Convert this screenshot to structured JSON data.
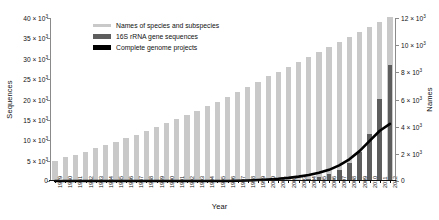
{
  "chart_data": {
    "type": "bar",
    "title": "",
    "xlabel": "Year",
    "ylabel": "Sequences",
    "ylabel_right": "Names",
    "grid": false,
    "legend_position": "top-left",
    "categories": [
      "1979",
      "1980",
      "1981",
      "1982",
      "1983",
      "1984",
      "1985",
      "1986",
      "1987",
      "1988",
      "1989",
      "1990",
      "1991",
      "1992",
      "1993",
      "1994",
      "1995",
      "1996",
      "1997",
      "1998",
      "1999",
      "2000",
      "2001",
      "2002",
      "2003",
      "2004",
      "2005",
      "2006",
      "2007",
      "2008",
      "2009",
      "2010",
      "2011",
      "2012"
    ],
    "ylim": [
      0,
      40000
    ],
    "yticks": [
      0,
      5000,
      10000,
      15000,
      20000,
      25000,
      30000,
      35000,
      40000
    ],
    "ytick_labels": [
      "0",
      "5 × 10³",
      "10 × 10³",
      "15 × 10³",
      "20 × 10³",
      "25 × 10³",
      "30 × 10³",
      "35 × 10³",
      "40 × 10³"
    ],
    "ylim_right": [
      0,
      12000
    ],
    "yticks_right": [
      0,
      2000,
      4000,
      6000,
      8000,
      10000,
      12000
    ],
    "ytick_labels_right": [
      "0",
      "2 × 10³",
      "4 × 10³",
      "6 × 10³",
      "8 × 10³",
      "10 × 10³",
      "12 × 10³"
    ],
    "series": [
      {
        "name": "Names of species and subspecies",
        "type": "bar",
        "axis": "right",
        "color": "#c9c9c9",
        "values": [
          1500,
          1750,
          1950,
          2150,
          2400,
          2650,
          2900,
          3150,
          3400,
          3700,
          3950,
          4250,
          4550,
          4850,
          5150,
          5500,
          5850,
          6200,
          6550,
          6950,
          7300,
          7700,
          8050,
          8400,
          8750,
          9100,
          9500,
          9900,
          10250,
          10600,
          11000,
          11350,
          11700,
          12050
        ]
      },
      {
        "name": "16S rRNA gene sequences",
        "type": "bar",
        "axis": "left",
        "color": "#5d5d5d",
        "values": [
          0,
          0,
          0,
          0,
          0,
          0,
          0,
          0,
          0,
          0,
          0,
          0,
          0,
          0,
          0,
          0,
          0,
          0,
          0,
          0,
          0,
          0,
          0,
          0,
          200,
          500,
          900,
          1600,
          2700,
          4300,
          7100,
          11500,
          20200,
          28500
        ]
      },
      {
        "name": "Complete genome projects",
        "type": "line",
        "axis": "right",
        "color": "#000000",
        "values": [
          0,
          0,
          0,
          0,
          0,
          0,
          0,
          0,
          0,
          0,
          0,
          0,
          0,
          0,
          0,
          0,
          0,
          0,
          20,
          40,
          70,
          110,
          160,
          230,
          320,
          440,
          600,
          820,
          1150,
          1600,
          2200,
          2950,
          3700,
          4200
        ]
      }
    ],
    "legend": [
      {
        "label": "Names of species and subspecies",
        "color": "#c9c9c9",
        "swatch": "light-gray-bar"
      },
      {
        "label": "16S rRNA gene sequences",
        "color": "#5d5d5d",
        "swatch": "dark-gray-bar"
      },
      {
        "label": "Complete genome projects",
        "color": "#000000",
        "swatch": "black-line"
      }
    ]
  }
}
